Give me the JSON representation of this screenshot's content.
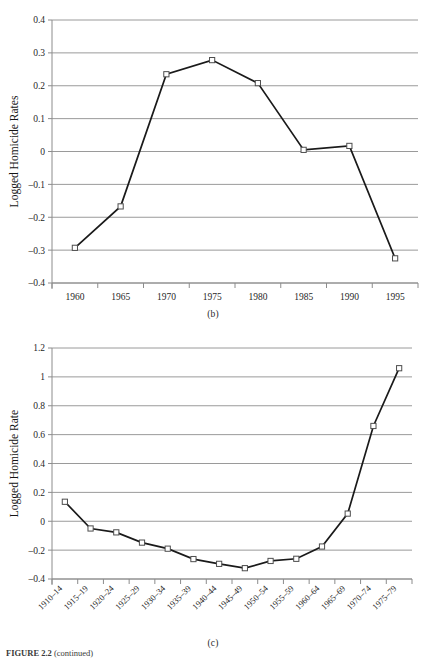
{
  "figure": {
    "caption_label": "FIGURE 2.2",
    "caption_rest": " (continued)"
  },
  "panels": [
    {
      "id": "b",
      "panel_label": "(b)"
    },
    {
      "id": "c",
      "panel_label": "(c)"
    }
  ],
  "chart_data": [
    {
      "type": "line",
      "title": "(b)",
      "xlabel": "",
      "ylabel": "Logged Homicide Rates",
      "categories": [
        "1960",
        "1965",
        "1970",
        "1975",
        "1980",
        "1985",
        "1990",
        "1995"
      ],
      "x": [
        1960,
        1965,
        1970,
        1975,
        1980,
        1985,
        1990,
        1995
      ],
      "values": [
        -0.293,
        -0.167,
        0.235,
        0.278,
        0.208,
        0.005,
        0.017,
        -0.325
      ],
      "ylim": [
        -0.4,
        0.4
      ],
      "yticks": [
        "0.4",
        "0.3",
        "0.2",
        "0.1",
        "0",
        "-0.1",
        "-0.2",
        "-0.3",
        "-0.4"
      ],
      "ytick_values": [
        0.4,
        0.3,
        0.2,
        0.1,
        0,
        -0.1,
        -0.2,
        -0.3,
        -0.4
      ],
      "xlim": [
        1957.5,
        1997.5
      ],
      "grid": true,
      "legend": "none",
      "marker": "open-square",
      "line_color": "#1a1a1a",
      "grid_color": "#9a9a9a"
    },
    {
      "type": "line",
      "title": "(c)",
      "xlabel": "",
      "ylabel": "Logged Homicide Rate",
      "categories": [
        "1910–14",
        "1915–19",
        "1920–24",
        "1925–29",
        "1930–34",
        "1935–39",
        "1940–44",
        "1945–49",
        "1950–54",
        "1955–59",
        "1960–64",
        "1965–69",
        "1970–74",
        "1975–79"
      ],
      "values": [
        0.135,
        -0.05,
        -0.077,
        -0.148,
        -0.19,
        -0.262,
        -0.295,
        -0.325,
        -0.275,
        -0.26,
        -0.175,
        0.053,
        0.66,
        1.06
      ],
      "ylim": [
        -0.4,
        1.2
      ],
      "yticks": [
        "1.2",
        "1",
        "0.8",
        "0.6",
        "0.4",
        "0.2",
        "0",
        "-0.2",
        "-0.4"
      ],
      "ytick_values": [
        1.2,
        1.0,
        0.8,
        0.6,
        0.4,
        0.2,
        0,
        -0.2,
        -0.4
      ],
      "grid": true,
      "legend": "none",
      "marker": "open-square",
      "line_color": "#1a1a1a",
      "grid_color": "#9a9a9a"
    }
  ]
}
